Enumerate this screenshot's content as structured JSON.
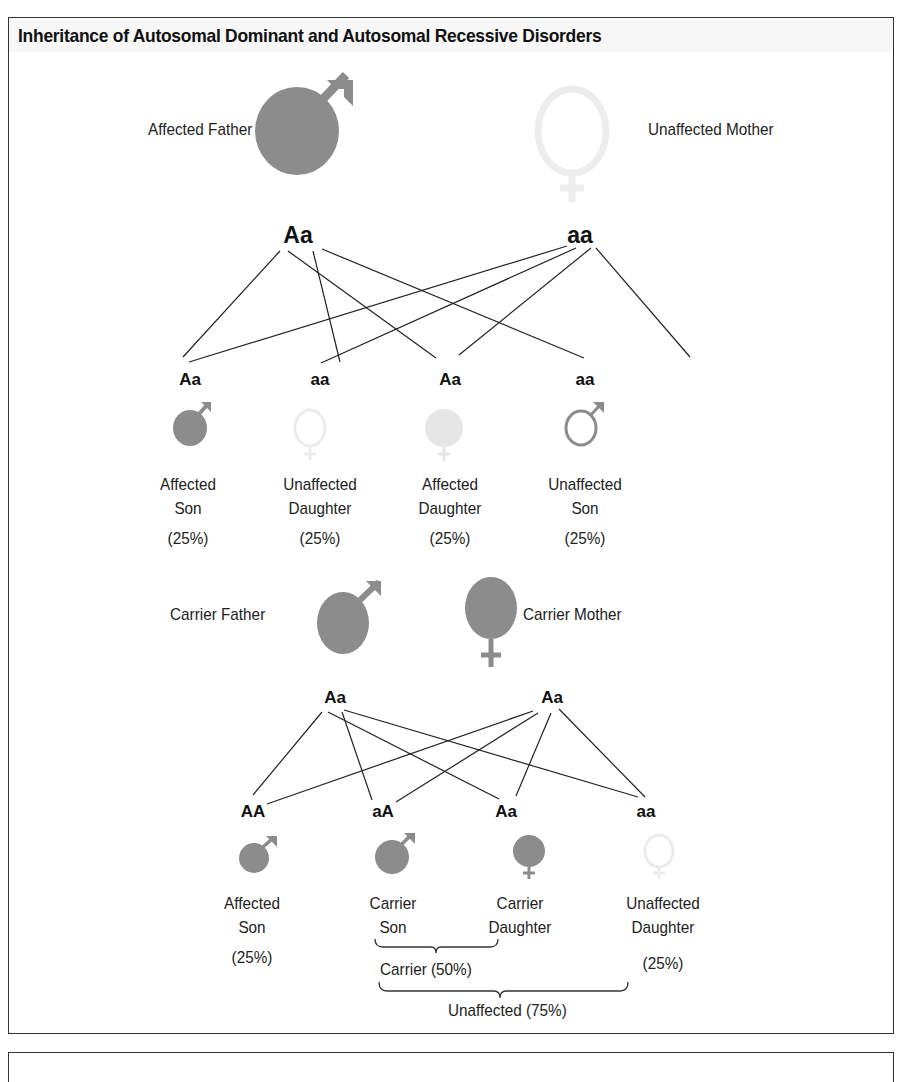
{
  "title": "Inheritance of Autosomal Dominant and Autosomal Recessive Disorders",
  "colors": {
    "affected_fill": "#8c8c8c",
    "unaffected_outline": "#ececec",
    "light_fill": "#e6e6e6",
    "son_outline": "#8c8c8c",
    "line": "#222222",
    "frame": "#333333"
  },
  "dominant": {
    "father": {
      "label": "Affected Father",
      "genotype": "Aa",
      "icon": "male-filled"
    },
    "mother": {
      "label": "Unaffected Mother",
      "genotype": "aa",
      "icon": "female-outline-faint"
    },
    "children": [
      {
        "genotype": "Aa",
        "line1": "Affected",
        "line2": "Son",
        "pct": "(25%)",
        "icon": "male-filled"
      },
      {
        "genotype": "aa",
        "line1": "Unaffected",
        "line2": "Daughter",
        "pct": "(25%)",
        "icon": "female-outline-faint"
      },
      {
        "genotype": "Aa",
        "line1": "Affected",
        "line2": "Daughter",
        "pct": "(25%)",
        "icon": "female-filled-faint"
      },
      {
        "genotype": "aa",
        "line1": "Unaffected",
        "line2": "Son",
        "pct": "(25%)",
        "icon": "male-outline"
      }
    ]
  },
  "recessive": {
    "father": {
      "label": "Carrier Father",
      "genotype": "Aa",
      "icon": "male-filled"
    },
    "mother": {
      "label": "Carrier Mother",
      "genotype": "Aa",
      "icon": "female-filled"
    },
    "children": [
      {
        "genotype": "AA",
        "line1": "Affected",
        "line2": "Son",
        "pct": "(25%)",
        "icon": "male-filled"
      },
      {
        "genotype": "aA",
        "line1": "Carrier",
        "line2": "Son",
        "pct": "",
        "icon": "male-filled"
      },
      {
        "genotype": "Aa",
        "line1": "Carrier",
        "line2": "Daughter",
        "pct": "",
        "icon": "female-filled"
      },
      {
        "genotype": "aa",
        "line1": "Unaffected",
        "line2": "Daughter",
        "pct": "(25%)",
        "icon": "female-outline-faint"
      }
    ],
    "brackets": {
      "carrier": "Carrier (50%)",
      "unaffected": "Unaffected (75%)"
    }
  }
}
